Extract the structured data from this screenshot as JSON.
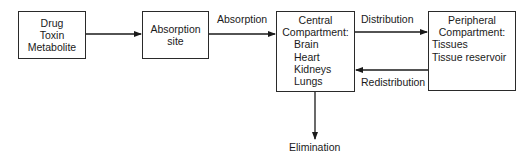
{
  "diagram": {
    "nodes": {
      "source": {
        "lines": [
          "Drug",
          "Toxin",
          "Metabolite"
        ]
      },
      "absorption_site": {
        "lines": [
          "Absorption",
          "site"
        ]
      },
      "central": {
        "title_lines": [
          "Central",
          "Compartment:"
        ],
        "items": [
          "Brain",
          "Heart",
          "Kidneys",
          "Lungs"
        ]
      },
      "peripheral": {
        "title_lines": [
          "Peripheral",
          "Compartment:"
        ],
        "items": [
          "Tissues",
          "Tissue reservoir"
        ]
      }
    },
    "edges": {
      "absorption": "Absorption",
      "distribution": "Distribution",
      "redistribution": "Redistribution",
      "elimination": "Elimination"
    }
  }
}
